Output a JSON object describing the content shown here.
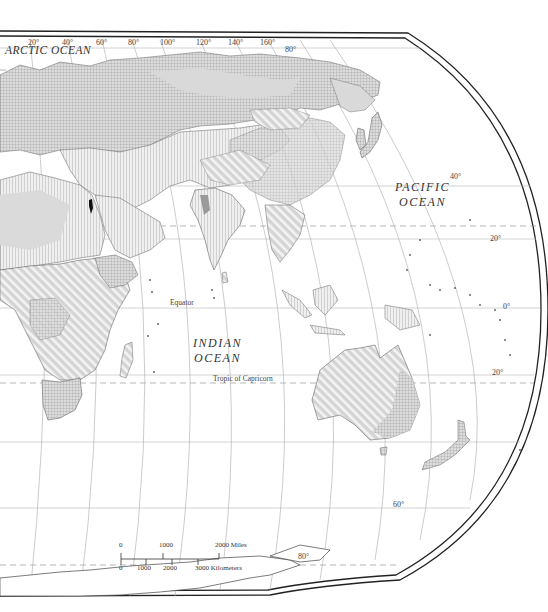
{
  "map": {
    "type": "thematic world map (Eastern Hemisphere, oval projection)",
    "ocean_labels": {
      "arctic": "ARCTIC OCEAN",
      "pacific_line1": "PACIFIC",
      "pacific_line2": "OCEAN",
      "indian_line1": "INDIAN",
      "indian_line2": "OCEAN"
    },
    "line_labels": {
      "equator": "Equator",
      "tropic_capricorn": "Tropic of Capricorn"
    },
    "longitude_labels": [
      "20°",
      "40°",
      "60°",
      "80°",
      "100°",
      "120°",
      "140°",
      "160°"
    ],
    "latitude_labels": {
      "lat80": "80°",
      "lat40": "40°",
      "lat20n": "20°",
      "lat0": "0°",
      "lat20s": "20°",
      "lat60s": "60°",
      "lat80s": "80°"
    },
    "scale_bar": {
      "miles": [
        "0",
        "1000",
        "2000 Miles"
      ],
      "kilometers": [
        "0",
        "1000",
        "2000",
        "3000 Kilometers"
      ]
    },
    "colors": {
      "land_fill": "#d6d6d6",
      "hatch": "#bdbdbd",
      "border": "#777777",
      "graticule": "#aaaaaa",
      "frame": "#222222",
      "highlight_israel": "#111111"
    }
  }
}
